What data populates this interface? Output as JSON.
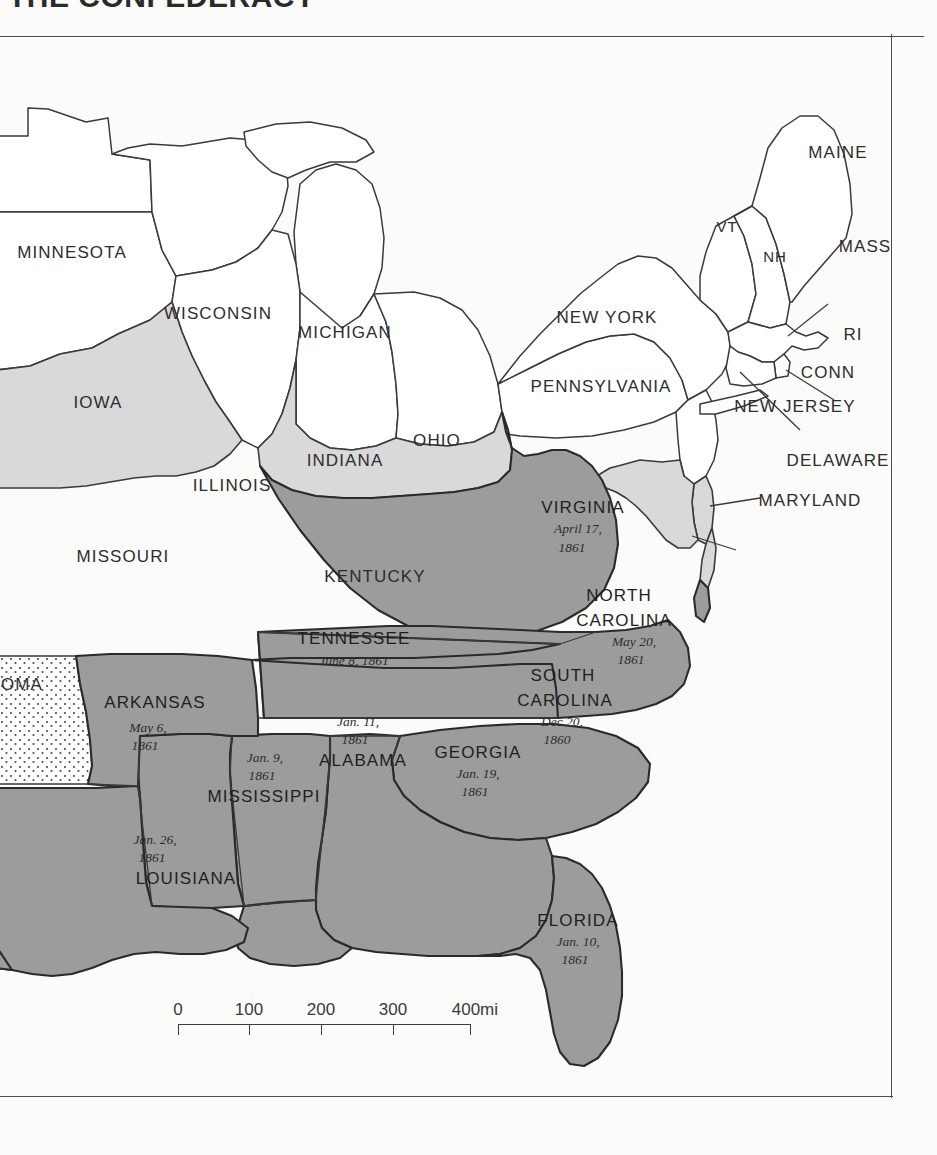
{
  "title": "THE CONFEDERACY",
  "map": {
    "legend_note": "",
    "colors": {
      "confederate_fill": "#9b9c9b",
      "border_state_fill": "#d9d9d9",
      "union_fill": "#ffffff",
      "territory_fill": "#ffffff",
      "outline": "#3a3a3a",
      "page_background": "#fbfbfa"
    },
    "confederate_states": [
      {
        "name": "SOUTH CAROLINA",
        "date_line1": "Dec 20,",
        "date_line2": "1860"
      },
      {
        "name": "MISSISSIPPI",
        "date_line1": "Jan. 9,",
        "date_line2": "1861"
      },
      {
        "name": "FLORIDA",
        "date_line1": "Jan. 10,",
        "date_line2": "1861"
      },
      {
        "name": "ALABAMA",
        "date_line1": "Jan. 11,",
        "date_line2": "1861"
      },
      {
        "name": "GEORGIA",
        "date_line1": "Jan. 19,",
        "date_line2": "1861"
      },
      {
        "name": "LOUISIANA",
        "date_line1": "Jan. 26,",
        "date_line2": "1861"
      },
      {
        "name": "VIRGINIA",
        "date_line1": "April 17,",
        "date_line2": "1861"
      },
      {
        "name": "ARKANSAS",
        "date_line1": "May 6,",
        "date_line2": "1861"
      },
      {
        "name": "NORTH CAROLINA",
        "date_line1": "May 20,",
        "date_line2": "1861"
      },
      {
        "name": "TENNESSEE",
        "date_line1": "June 8, 1861",
        "date_line2": ""
      }
    ],
    "labels": {
      "minnesota": "MINNESOTA",
      "wisconsin": "WISCONSIN",
      "michigan": "MICHIGAN",
      "iowa": "IOWA",
      "illinois": "ILLINOIS",
      "indiana": "INDIANA",
      "ohio": "OHIO",
      "missouri": "MISSOURI",
      "kentucky": "KENTUCKY",
      "oklahoma": "OMA",
      "maine": "MAINE",
      "vermont": "VT",
      "new_hampshire": "NH",
      "massachusetts": "MASS",
      "rhode_island": "RI",
      "connecticut": "CONN",
      "new_york": "NEW YORK",
      "pennsylvania": "PENNSYLVANIA",
      "new_jersey": "NEW JERSEY",
      "delaware": "DELAWARE",
      "maryland": "MARYLAND",
      "virginia": "VIRGINIA",
      "north_carolina_l1": "NORTH",
      "north_carolina_l2": "CAROLINA",
      "south_carolina_l1": "SOUTH",
      "south_carolina_l2": "CAROLINA",
      "georgia": "GEORGIA",
      "florida": "FLORIDA",
      "alabama": "ALABAMA",
      "mississippi": "MISSISSIPPI",
      "louisiana": "LOUISIANA",
      "arkansas": "ARKANSAS",
      "tennessee": "TENNESSEE"
    },
    "dates": {
      "virginia_l1": "April 17,",
      "virginia_l2": "1861",
      "north_carolina_l1": "May 20,",
      "north_carolina_l2": "1861",
      "south_carolina_l1": "Dec 20,",
      "south_carolina_l2": "1860",
      "georgia_l1": "Jan. 19,",
      "georgia_l2": "1861",
      "florida_l1": "Jan. 10,",
      "florida_l2": "1861",
      "alabama_l1": "Jan. 11,",
      "alabama_l2": "1861",
      "mississippi_l1": "Jan. 9,",
      "mississippi_l2": "1861",
      "louisiana_l1": "Jan. 26,",
      "louisiana_l2": "1861",
      "arkansas_l1": "May 6,",
      "arkansas_l2": "1861",
      "tennessee_l1": "June 8, 1861"
    }
  },
  "scale": {
    "ticks": [
      "0",
      "100",
      "200",
      "300",
      "400"
    ],
    "unit": "mi"
  }
}
